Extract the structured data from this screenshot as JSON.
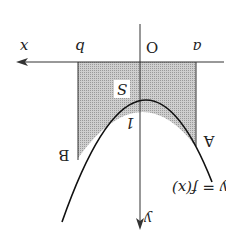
{
  "figure": {
    "orientation": "rotated 180 degrees",
    "labels": {
      "x_axis": "x",
      "y_axis": "y",
      "origin": "O",
      "a": "a",
      "b": "b",
      "area": "S",
      "y_intercept": "1",
      "point_a": "A",
      "point_b": "B",
      "curve": "y = f(x)"
    },
    "colors": {
      "axis": "#333333",
      "curve": "#111111",
      "shading": "#bdbdbd",
      "background": "#ffffff"
    }
  }
}
